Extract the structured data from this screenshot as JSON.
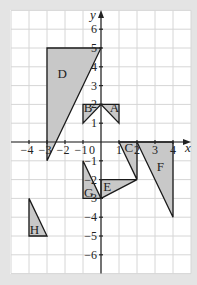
{
  "diagram": {
    "type": "coordinate-grid",
    "x_axis": {
      "label": "x",
      "range": [
        -5,
        5
      ],
      "ticks": [
        -4,
        -3,
        -2,
        -1,
        1,
        2,
        3,
        4
      ],
      "origin_label": "0"
    },
    "y_axis": {
      "label": "y",
      "range": [
        -7,
        7
      ],
      "ticks": [
        6,
        5,
        4,
        3,
        2,
        1,
        -1,
        -2,
        -3,
        -4,
        -5,
        -6
      ]
    },
    "colors": {
      "background": "#e4e4e4",
      "grid_bg": "#ffffff",
      "grid_line": "#d6d6d6",
      "shape_fill": "#c8c8c8",
      "stroke": "#1a1a1a"
    },
    "shapes": [
      {
        "label": "A",
        "vertices": [
          [
            0,
            2
          ],
          [
            1,
            2
          ],
          [
            1,
            1
          ]
        ],
        "label_pos": [
          0.75,
          1.75
        ]
      },
      {
        "label": "B",
        "vertices": [
          [
            -1,
            2
          ],
          [
            0,
            2
          ],
          [
            -1,
            1
          ]
        ],
        "label_pos": [
          -0.72,
          1.75
        ]
      },
      {
        "label": "C",
        "vertices": [
          [
            1,
            0
          ],
          [
            2,
            0
          ],
          [
            2,
            -2
          ]
        ],
        "label_pos": [
          1.55,
          -0.35
        ]
      },
      {
        "label": "D",
        "vertices": [
          [
            -3,
            5
          ],
          [
            0,
            5
          ],
          [
            -3,
            -1
          ]
        ],
        "label_pos": [
          -2.15,
          3.55
        ]
      },
      {
        "label": "E",
        "vertices": [
          [
            0,
            -2
          ],
          [
            2,
            -2
          ],
          [
            0,
            -3
          ]
        ],
        "label_pos": [
          0.35,
          -2.45
        ]
      },
      {
        "label": "F",
        "vertices": [
          [
            2,
            0
          ],
          [
            4,
            0
          ],
          [
            4,
            -4
          ]
        ],
        "label_pos": [
          3.3,
          -1.4
        ]
      },
      {
        "label": "G",
        "vertices": [
          [
            -1,
            -1
          ],
          [
            0,
            -3
          ],
          [
            -1,
            -3
          ]
        ],
        "label_pos": [
          -0.68,
          -2.75
        ]
      },
      {
        "label": "H",
        "vertices": [
          [
            -4,
            -3
          ],
          [
            -3,
            -5
          ],
          [
            -4,
            -5
          ]
        ],
        "label_pos": [
          -3.7,
          -4.75
        ]
      }
    ]
  }
}
